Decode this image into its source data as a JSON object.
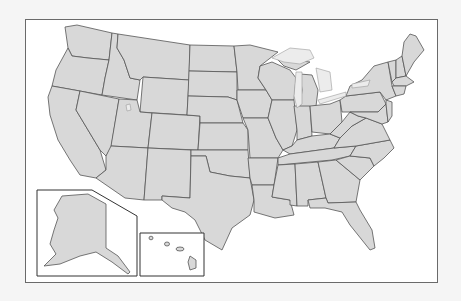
{
  "map": {
    "title": "United States outline map",
    "type": "blank state boundary map",
    "colors": {
      "background": "#f5f5f5",
      "frame": "#ffffff",
      "frame_border": "#6a6a6a",
      "land_fill": "#d8d8d8",
      "state_border": "#555555",
      "lakes": "#ececec"
    },
    "regions": [
      "Contiguous United States",
      "Alaska inset",
      "Hawaii inset"
    ],
    "insets": [
      {
        "name": "Alaska",
        "position": "bottom-left"
      },
      {
        "name": "Hawaii",
        "position": "bottom-center-left"
      }
    ],
    "labels_visible": false
  }
}
